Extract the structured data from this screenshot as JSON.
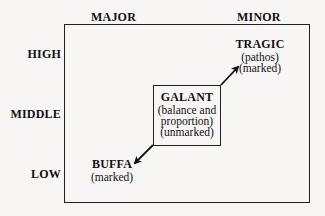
{
  "columns": {
    "major": "MAJOR",
    "minor": "MINOR"
  },
  "rows": {
    "high": "HIGH",
    "middle": "MIDDLE",
    "low": "LOW"
  },
  "nodes": {
    "tragic": {
      "title": "TRAGIC",
      "lines": [
        "(pathos)",
        "(marked)"
      ]
    },
    "galant": {
      "title": "GALANT",
      "lines": [
        "(balance and",
        "proportion)",
        "(unmarked)"
      ]
    },
    "buffa": {
      "title": "BUFFA",
      "lines": [
        "(marked)"
      ]
    }
  },
  "edges": [
    {
      "from": "galant",
      "to": "tragic"
    },
    {
      "from": "galant",
      "to": "buffa"
    }
  ]
}
